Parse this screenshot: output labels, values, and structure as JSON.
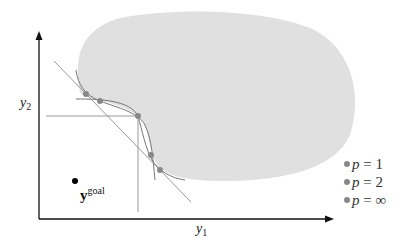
{
  "diagram": {
    "type": "pareto-front-lp-scalarization",
    "axes": {
      "x_label_base": "y",
      "x_label_sub": "1",
      "y_label_base": "y",
      "y_label_sub": "2"
    },
    "goal_point": {
      "label_base": "y",
      "label_sup": "goal"
    },
    "feasible_region_color": "#e0e0e0",
    "curve_color": "#777777",
    "point_color": "#888888",
    "axis_color": "#111111",
    "points": [
      {
        "x": 86,
        "y": 94
      },
      {
        "x": 100,
        "y": 101
      },
      {
        "x": 138,
        "y": 116
      },
      {
        "x": 151,
        "y": 155
      },
      {
        "x": 160,
        "y": 170
      }
    ],
    "legend": [
      {
        "var": "p",
        "eq": " = ",
        "val": "1"
      },
      {
        "var": "p",
        "eq": " = ",
        "val": "2"
      },
      {
        "var": "p",
        "eq": " = ",
        "val": "∞"
      }
    ]
  }
}
